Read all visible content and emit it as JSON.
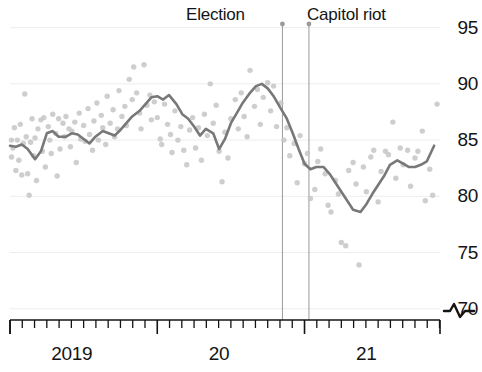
{
  "chart_data": {
    "type": "scatter",
    "title": "",
    "subtitle": "",
    "xlabel": "",
    "ylabel": "",
    "xlim": [
      2019.0,
      2021.92
    ],
    "ylim": [
      69.0,
      95.5
    ],
    "grid": true,
    "grid_axis": "y",
    "legend": "none",
    "y_ticks": [
      95,
      90,
      85,
      80,
      75,
      70
    ],
    "y_tick_labels": [
      "95",
      "90",
      "85",
      "80",
      "75",
      "70"
    ],
    "axis_break_symbol": "broken-axis-squiggle",
    "x_tick_labels": [
      "2019",
      "20",
      "21"
    ],
    "x_tick_label_positions": [
      2019.42,
      2020.42,
      2021.42
    ],
    "x_minor_tick_interval_months": 1,
    "x_major_tick_years": [
      2019,
      2020,
      2021
    ],
    "series": [
      {
        "name": "observations",
        "type": "scatter",
        "marker": "circle",
        "color": "#c6c6c6",
        "x": [
          2019.01,
          2019.01,
          2019.02,
          2019.03,
          2019.04,
          2019.05,
          2019.06,
          2019.07,
          2019.08,
          2019.09,
          2019.1,
          2019.11,
          2019.12,
          2019.13,
          2019.14,
          2019.15,
          2019.16,
          2019.17,
          2019.18,
          2019.19,
          2019.21,
          2019.22,
          2019.23,
          2019.24,
          2019.26,
          2019.27,
          2019.28,
          2019.29,
          2019.31,
          2019.32,
          2019.33,
          2019.34,
          2019.36,
          2019.37,
          2019.38,
          2019.4,
          2019.41,
          2019.42,
          2019.44,
          2019.45,
          2019.47,
          2019.48,
          2019.5,
          2019.51,
          2019.53,
          2019.54,
          2019.56,
          2019.57,
          2019.59,
          2019.6,
          2019.62,
          2019.63,
          2019.65,
          2019.66,
          2019.68,
          2019.7,
          2019.71,
          2019.73,
          2019.74,
          2019.76,
          2019.78,
          2019.79,
          2019.81,
          2019.83,
          2019.84,
          2019.86,
          2019.88,
          2019.89,
          2019.91,
          2019.93,
          2019.95,
          2019.96,
          2019.98,
          2020.0,
          2020.02,
          2020.03,
          2020.05,
          2020.07,
          2020.09,
          2020.1,
          2020.12,
          2020.14,
          2020.16,
          2020.18,
          2020.2,
          2020.22,
          2020.24,
          2020.26,
          2020.28,
          2020.3,
          2020.32,
          2020.34,
          2020.36,
          2020.38,
          2020.4,
          2020.42,
          2020.44,
          2020.46,
          2020.48,
          2020.5,
          2020.53,
          2020.55,
          2020.57,
          2020.59,
          2020.61,
          2020.63,
          2020.66,
          2020.68,
          2020.7,
          2020.72,
          2020.75,
          2020.77,
          2020.79,
          2020.81,
          2020.84,
          2020.86,
          2020.88,
          2020.9,
          2020.93,
          2020.95,
          2020.97,
          2021.0,
          2021.02,
          2021.04,
          2021.07,
          2021.09,
          2021.11,
          2021.14,
          2021.16,
          2021.18,
          2021.21,
          2021.23,
          2021.25,
          2021.28,
          2021.3,
          2021.33,
          2021.35,
          2021.37,
          2021.4,
          2021.42,
          2021.45,
          2021.47,
          2021.5,
          2021.52,
          2021.55,
          2021.57,
          2021.6,
          2021.62,
          2021.65,
          2021.67,
          2021.7,
          2021.72,
          2021.75,
          2021.77,
          2021.8,
          2021.82,
          2021.85,
          2021.87,
          2021.9
        ],
        "y": [
          85.0,
          83.5,
          84.3,
          86.1,
          82.3,
          85.0,
          83.2,
          86.4,
          81.9,
          84.7,
          89.1,
          85.3,
          82.0,
          80.1,
          84.8,
          86.9,
          83.6,
          85.2,
          81.4,
          86.0,
          86.8,
          84.0,
          87.0,
          82.6,
          86.2,
          85.0,
          83.8,
          87.3,
          85.6,
          81.8,
          86.9,
          84.2,
          86.5,
          85.3,
          87.1,
          86.0,
          84.4,
          85.8,
          86.6,
          83.0,
          87.4,
          85.1,
          86.3,
          84.9,
          87.8,
          85.5,
          84.1,
          86.7,
          88.3,
          85.0,
          87.2,
          86.1,
          84.6,
          88.9,
          86.5,
          87.7,
          85.3,
          86.0,
          89.4,
          87.1,
          88.0,
          86.3,
          90.4,
          88.6,
          91.5,
          89.2,
          87.4,
          86.0,
          91.7,
          88.1,
          89.0,
          86.8,
          88.4,
          87.0,
          85.1,
          84.6,
          88.2,
          86.4,
          85.5,
          83.9,
          87.6,
          85.0,
          86.2,
          84.1,
          82.8,
          85.9,
          87.0,
          84.3,
          86.1,
          83.2,
          87.3,
          85.4,
          90.0,
          86.5,
          88.1,
          84.0,
          81.3,
          85.7,
          83.4,
          86.9,
          88.6,
          86.0,
          89.2,
          87.1,
          85.3,
          91.2,
          88.0,
          89.5,
          86.4,
          88.8,
          90.1,
          87.6,
          89.8,
          86.2,
          88.3,
          85.0,
          86.1,
          83.6,
          84.7,
          81.2,
          85.4,
          82.9,
          83.8,
          79.8,
          80.6,
          83.1,
          84.2,
          82.0,
          79.2,
          78.6,
          81.4,
          80.2,
          75.9,
          75.6,
          82.3,
          83.0,
          81.1,
          73.9,
          82.6,
          80.4,
          83.5,
          84.1,
          79.5,
          82.2,
          84.0,
          83.7,
          86.6,
          81.6,
          84.3,
          82.8,
          84.1,
          80.9,
          83.4,
          84.0,
          85.8,
          79.6,
          82.4,
          80.1,
          88.2
        ]
      },
      {
        "name": "smoothed trend",
        "type": "line",
        "color": "#787878",
        "x": [
          2019.0,
          2019.04,
          2019.08,
          2019.12,
          2019.17,
          2019.21,
          2019.25,
          2019.29,
          2019.33,
          2019.38,
          2019.42,
          2019.46,
          2019.5,
          2019.54,
          2019.58,
          2019.63,
          2019.67,
          2019.71,
          2019.75,
          2019.79,
          2019.83,
          2019.88,
          2019.92,
          2019.96,
          2020.0,
          2020.04,
          2020.08,
          2020.13,
          2020.17,
          2020.21,
          2020.25,
          2020.29,
          2020.33,
          2020.38,
          2020.42,
          2020.46,
          2020.5,
          2020.54,
          2020.58,
          2020.63,
          2020.67,
          2020.71,
          2020.75,
          2020.79,
          2020.83,
          2020.88,
          2020.92,
          2020.96,
          2021.0,
          2021.04,
          2021.08,
          2021.13,
          2021.17,
          2021.21,
          2021.25,
          2021.29,
          2021.33,
          2021.38,
          2021.42,
          2021.46,
          2021.5,
          2021.54,
          2021.58,
          2021.63,
          2021.67,
          2021.71,
          2021.75,
          2021.79,
          2021.83,
          2021.88
        ],
        "y": [
          84.5,
          84.4,
          84.6,
          84.2,
          83.3,
          84.0,
          85.6,
          85.8,
          85.3,
          85.3,
          85.6,
          85.5,
          85.1,
          84.7,
          85.3,
          85.8,
          85.6,
          85.4,
          85.9,
          86.5,
          87.1,
          87.6,
          88.2,
          88.8,
          88.9,
          88.6,
          89.0,
          88.2,
          87.3,
          86.9,
          86.2,
          85.4,
          86.0,
          85.6,
          84.2,
          85.1,
          86.5,
          87.4,
          88.3,
          89.2,
          89.8,
          90.0,
          89.6,
          88.9,
          88.0,
          86.9,
          85.6,
          84.2,
          82.9,
          82.4,
          82.6,
          82.6,
          82.0,
          81.2,
          80.4,
          79.6,
          78.8,
          78.6,
          79.3,
          80.2,
          81.0,
          81.8,
          82.8,
          83.2,
          82.9,
          82.6,
          82.6,
          82.8,
          83.1,
          84.5
        ]
      }
    ],
    "event_markers": [
      {
        "label": "Election",
        "x": 2020.85,
        "marker": "dot",
        "line_style": "solid",
        "color": "#9a9a9a"
      },
      {
        "label": "Capitol riot",
        "x": 2021.03,
        "marker": "dot",
        "line_style": "solid",
        "color": "#9a9a9a"
      }
    ]
  },
  "colors": {
    "point": "#c6c6c6",
    "line": "#787878",
    "event_line": "#9a9a9a",
    "grid": "#ededed",
    "axis": "#141414",
    "text": "#141414",
    "background": "#ffffff"
  }
}
